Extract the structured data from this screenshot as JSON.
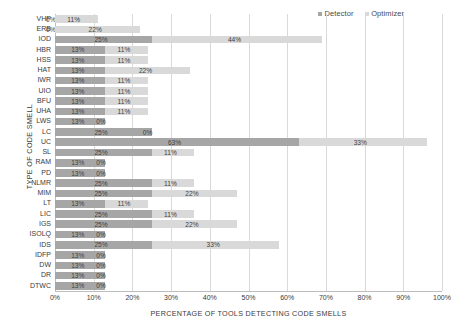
{
  "chart_data": {
    "type": "bar",
    "orientation": "horizontal",
    "stacked": true,
    "title": "",
    "xlabel": "PERCENTAGE OF TOOLS DETECTING CODE SMELLS",
    "ylabel": "TYPE OF CODE SMELL",
    "xlim": [
      0,
      100
    ],
    "xticks": [
      "0%",
      "10%",
      "20%",
      "30%",
      "40%",
      "50%",
      "60%",
      "70%",
      "80%",
      "90%",
      "100%"
    ],
    "xtick_values": [
      0,
      10,
      20,
      30,
      40,
      50,
      60,
      70,
      80,
      90,
      100
    ],
    "grid": true,
    "legend_position": "top-right",
    "categories": [
      "VHP",
      "ERB",
      "IOD",
      "HBR",
      "HSS",
      "HAT",
      "IWR",
      "UIO",
      "BFU",
      "UHA",
      "LWS",
      "LC",
      "UC",
      "SL",
      "RAM",
      "PD",
      "NLMR",
      "MIM",
      "LT",
      "LIC",
      "IGS",
      "ISOLQ",
      "IDS",
      "IDFP",
      "DW",
      "DR",
      "DTWC"
    ],
    "series": [
      {
        "name": "Detector",
        "color": "#a6a6a6",
        "values": [
          0,
          0,
          25,
          13,
          13,
          13,
          13,
          13,
          13,
          13,
          13,
          25,
          63,
          25,
          13,
          13,
          25,
          25,
          13,
          25,
          25,
          13,
          25,
          13,
          13,
          13,
          13
        ],
        "labels": [
          "0%",
          "0%",
          "25%",
          "13%",
          "13%",
          "13%",
          "13%",
          "13%",
          "13%",
          "13%",
          "13%",
          "25%",
          "63%",
          "25%",
          "13%",
          "13%",
          "25%",
          "25%",
          "13%",
          "25%",
          "25%",
          "13%",
          "25%",
          "13%",
          "13%",
          "13%",
          "13%"
        ]
      },
      {
        "name": "Optimizer",
        "color": "#d9d9d9",
        "values": [
          11,
          22,
          44,
          11,
          11,
          22,
          11,
          11,
          11,
          11,
          0,
          0,
          33,
          11,
          0,
          0,
          11,
          22,
          11,
          11,
          22,
          0,
          33,
          0,
          0,
          0,
          0
        ],
        "labels": [
          "11%",
          "22%",
          "44%",
          "11%",
          "11%",
          "22%",
          "11%",
          "11%",
          "11%",
          "11%",
          "0%",
          "0%",
          "33%",
          "11%",
          "0%",
          "0%",
          "11%",
          "22%",
          "11%",
          "11%",
          "22%",
          "0%",
          "33%",
          "0%",
          "0%",
          "0%",
          "0%"
        ]
      }
    ]
  },
  "legend": {
    "entries": [
      {
        "label": "Detector",
        "color": "#a6a6a6"
      },
      {
        "label": "Optimizer",
        "color": "#d9d9d9"
      }
    ]
  }
}
